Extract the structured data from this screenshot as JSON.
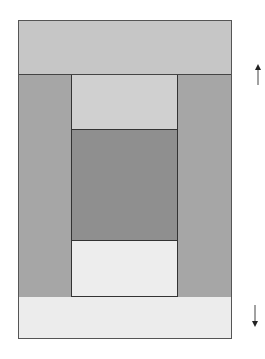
{
  "diagram": {
    "type": "quilt-block",
    "pieces": [
      {
        "id": "top-band",
        "color": "#c4c4c4",
        "x": 18,
        "y": 20,
        "w": 214,
        "h": 55
      },
      {
        "id": "left-column",
        "color": "#a4a4a4",
        "x": 18,
        "y": 75,
        "w": 54,
        "h": 222
      },
      {
        "id": "right-column",
        "color": "#a4a4a4",
        "x": 177,
        "y": 75,
        "w": 55,
        "h": 222
      },
      {
        "id": "center-top",
        "color": "#cfcfcf",
        "x": 72,
        "y": 75,
        "w": 105,
        "h": 55
      },
      {
        "id": "center-middle",
        "color": "#8e8e8e",
        "x": 72,
        "y": 130,
        "w": 105,
        "h": 111
      },
      {
        "id": "center-bottom",
        "color": "#ececec",
        "x": 72,
        "y": 241,
        "w": 105,
        "h": 56
      },
      {
        "id": "bottom-band",
        "color": "#ececec",
        "x": 18,
        "y": 297,
        "w": 214,
        "h": 42
      }
    ],
    "arrows": [
      {
        "id": "up-arrow",
        "direction": "up"
      },
      {
        "id": "down-arrow",
        "direction": "down"
      }
    ]
  }
}
